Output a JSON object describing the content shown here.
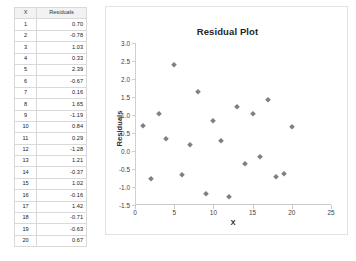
{
  "table": {
    "headers": [
      "X",
      "Residuals"
    ],
    "rows": [
      {
        "x": "1",
        "residual": "0.70"
      },
      {
        "x": "2",
        "residual": "-0.78"
      },
      {
        "x": "3",
        "residual": "1.03"
      },
      {
        "x": "4",
        "residual": "0.33"
      },
      {
        "x": "5",
        "residual": "2.39"
      },
      {
        "x": "6",
        "residual": "-0.67"
      },
      {
        "x": "7",
        "residual": "0.16"
      },
      {
        "x": "8",
        "residual": "1.65"
      },
      {
        "x": "9",
        "residual": "-1.19"
      },
      {
        "x": "10",
        "residual": "0.84"
      },
      {
        "x": "11",
        "residual": "0.29"
      },
      {
        "x": "12",
        "residual": "-1.28"
      },
      {
        "x": "13",
        "residual": "1.21"
      },
      {
        "x": "14",
        "residual": "-0.37"
      },
      {
        "x": "15",
        "residual": "1.02"
      },
      {
        "x": "16",
        "residual": "-0.16"
      },
      {
        "x": "17",
        "residual": "1.42"
      },
      {
        "x": "18",
        "residual": "-0.71"
      },
      {
        "x": "19",
        "residual": "-0.63"
      },
      {
        "x": "20",
        "residual": "0.67"
      }
    ]
  },
  "chart_data": {
    "type": "scatter",
    "title": "Residual Plot",
    "xlabel": "X",
    "ylabel": "Residuals",
    "xlim": [
      0,
      25
    ],
    "ylim": [
      -1.5,
      3.0
    ],
    "xticks": [
      0,
      5,
      10,
      15,
      20,
      25
    ],
    "xtick_labels": [
      "0",
      "5",
      "10",
      "15",
      "20",
      "25"
    ],
    "yticks": [
      -1.5,
      -1.0,
      -0.5,
      0.0,
      0.5,
      1.0,
      1.5,
      2.0,
      2.5,
      3.0
    ],
    "ytick_labels": [
      "-1.5",
      "-1.0",
      "-0.5",
      "0.0",
      "0.5",
      "1.0",
      "1.5",
      "2.0",
      "2.5",
      "3.0"
    ],
    "grid": false,
    "legend": false,
    "marker": "diamond",
    "marker_color": "#808080",
    "x": [
      1,
      2,
      3,
      4,
      5,
      6,
      7,
      8,
      9,
      10,
      11,
      12,
      13,
      14,
      15,
      16,
      17,
      18,
      19,
      20
    ],
    "y": [
      0.7,
      -0.78,
      1.03,
      0.33,
      2.39,
      -0.67,
      0.16,
      1.65,
      -1.19,
      0.84,
      0.29,
      -1.28,
      1.21,
      -0.37,
      1.02,
      -0.16,
      1.42,
      -0.71,
      -0.63,
      0.67
    ]
  }
}
